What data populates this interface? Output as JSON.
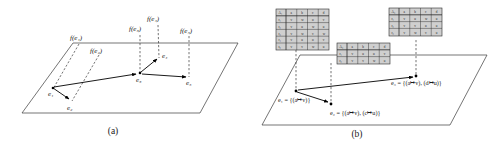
{
  "figure": {
    "panels": [
      {
        "id": "a",
        "caption": "(a)",
        "description": "event graph embedded in a plane with projection lines to time axis",
        "nodes": [
          {
            "name": "e1",
            "label": "e₁",
            "x": 52,
            "y": 88
          },
          {
            "name": "e2",
            "label": "e₂",
            "x": 71,
            "y": 101
          },
          {
            "name": "e3",
            "label": "e₃",
            "x": 139,
            "y": 73
          },
          {
            "name": "e4",
            "label": "e₄",
            "x": 159,
            "y": 57
          },
          {
            "name": "e5",
            "label": "e₅",
            "x": 189,
            "y": 76
          }
        ],
        "edges": [
          {
            "from": "e1",
            "to": "e2"
          },
          {
            "from": "e1",
            "to": "e3"
          },
          {
            "from": "e3",
            "to": "e4"
          },
          {
            "from": "e3",
            "to": "e5"
          }
        ],
        "projection_labels": [
          {
            "name": "f-e1",
            "label": "f(e₁)",
            "x": 76,
            "y": 37
          },
          {
            "name": "f-e2",
            "label": "f(e₂)",
            "x": 96,
            "y": 50
          },
          {
            "name": "f-e3",
            "label": "f(e₃)",
            "x": 139,
            "y": 30
          },
          {
            "name": "f-e4",
            "label": "f(e₄)",
            "x": 157,
            "y": 20
          },
          {
            "name": "f-e5",
            "label": "f(e₅)",
            "x": 189,
            "y": 31
          }
        ]
      },
      {
        "id": "b",
        "caption": "(b)",
        "description": "same events annotated with attribute-value relation tables",
        "nodes": [
          {
            "name": "e1",
            "label": "e₁",
            "x": 296,
            "y": 91
          },
          {
            "name": "e2",
            "label": "e₂",
            "x": 331,
            "y": 104
          },
          {
            "name": "e3",
            "label": "e₃",
            "x": 416,
            "y": 76
          }
        ],
        "edges": [
          {
            "from": "e1",
            "to": "e2"
          },
          {
            "from": "e1",
            "to": "e3"
          }
        ],
        "event_equations": [
          {
            "name": "eq-e1",
            "text": "e₁ = {(a↦v)}",
            "x": 280,
            "y": 101
          },
          {
            "name": "eq-e2",
            "text": "e₂ = {(a↦v), (c↦u)}",
            "x": 330,
            "y": 113
          },
          {
            "name": "eq-e3",
            "text": "e₃ = {(a↦v), (d↦u)}",
            "x": 391,
            "y": 84
          }
        ],
        "tables": [
          {
            "name": "relation-table-1",
            "corner": "A₁",
            "columns": [
              "a",
              "b",
              "c",
              "d"
            ],
            "rows": [
              {
                "label": "r₁",
                "cells": [
                  "v",
                  "w",
                  "u",
                  "v"
                ]
              },
              {
                "label": "r₂",
                "cells": [
                  "v",
                  "u",
                  "w",
                  "u"
                ]
              },
              {
                "label": "r₃",
                "cells": [
                  "v",
                  "w",
                  "v",
                  "w"
                ]
              },
              {
                "label": "r₄",
                "cells": [
                  "v",
                  "u",
                  "u",
                  "v"
                ]
              },
              {
                "label": "r₅",
                "cells": [
                  "v",
                  "v",
                  "w",
                  "u"
                ]
              }
            ]
          },
          {
            "name": "relation-table-2",
            "corner": "A₂",
            "columns": [
              "a",
              "b",
              "c",
              "d"
            ],
            "rows": [
              {
                "label": "r₁",
                "cells": [
                  "v",
                  "u",
                  "u",
                  "v"
                ]
              },
              {
                "label": "r₂",
                "cells": [
                  "v",
                  "v",
                  "w",
                  "u"
                ]
              }
            ]
          },
          {
            "name": "relation-table-3",
            "corner": "A₃",
            "columns": [
              "a",
              "b",
              "c",
              "d"
            ],
            "rows": [
              {
                "label": "r₁",
                "cells": [
                  "v",
                  "u",
                  "w",
                  "u"
                ]
              },
              {
                "label": "r₂",
                "cells": [
                  "v",
                  "v",
                  "u",
                  "u"
                ]
              },
              {
                "label": "r₃",
                "cells": [
                  "v",
                  "w",
                  "v",
                  "u"
                ]
              }
            ]
          }
        ]
      }
    ]
  }
}
